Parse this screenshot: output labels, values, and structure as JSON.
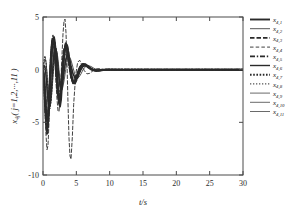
{
  "chart_data": {
    "type": "line",
    "title": "",
    "subtitle": "",
    "xlabel": "t/s",
    "ylabel": "x4j (j=1,2,...,11)",
    "ylabel_base": "x",
    "ylabel_base_sub": "4j",
    "ylabel_paren": "( j=1,2,···,11 )",
    "xlim": [
      0,
      30
    ],
    "ylim": [
      -10,
      5
    ],
    "xticks": [
      0,
      5,
      10,
      15,
      20,
      25,
      30
    ],
    "xticklabels": [
      "0",
      "5",
      "10",
      "15",
      "20",
      "25",
      "30"
    ],
    "yticks": [
      5,
      0,
      -5,
      -10
    ],
    "yticklabels": [
      "5",
      "0",
      "-5",
      "-10"
    ],
    "grid": false,
    "legend_position": "outside-right",
    "line_color": "#2a2a2a",
    "series": [
      {
        "name": "x4,1",
        "label_base": "x",
        "label_sub": "4,1",
        "style": "solid",
        "width": 1.9,
        "dash": "none",
        "x": [
          0,
          0.15,
          0.3,
          0.45,
          0.6,
          0.75,
          0.9,
          1.05,
          1.2,
          1.35,
          1.5,
          1.65,
          1.8,
          1.95,
          2.1,
          2.25,
          2.4,
          2.55,
          2.7,
          2.85,
          3.0,
          3.2,
          3.4,
          3.6,
          3.8,
          4.0,
          4.2,
          4.5,
          4.8,
          5.1,
          5.4,
          5.7,
          6.0,
          6.4,
          6.8,
          7.2,
          7.6,
          8.0,
          8.5,
          9.0,
          9.5,
          10.0,
          11,
          13,
          16,
          20,
          25,
          30
        ],
        "y": [
          0,
          -0.9,
          -2.6,
          -4.4,
          -5.6,
          -5.2,
          -3.4,
          -1.0,
          0.9,
          2.2,
          2.9,
          3.1,
          2.5,
          1.2,
          -0.6,
          -2.2,
          -3.2,
          -3.5,
          -2.9,
          -1.5,
          0.2,
          1.7,
          2.4,
          2.3,
          1.6,
          0.5,
          -0.5,
          -1.3,
          -1.2,
          -0.7,
          -0.1,
          0.35,
          0.55,
          0.5,
          0.28,
          0.08,
          -0.05,
          -0.1,
          -0.08,
          -0.03,
          0.0,
          0.01,
          0.0,
          0,
          0,
          0,
          0,
          0
        ]
      },
      {
        "name": "x4,2",
        "label_base": "x",
        "label_sub": "4,2",
        "style": "solid",
        "width": 0.8,
        "dash": "none",
        "x": [
          0,
          0.15,
          0.3,
          0.45,
          0.6,
          0.75,
          0.9,
          1.05,
          1.2,
          1.35,
          1.5,
          1.65,
          1.8,
          1.95,
          2.1,
          2.25,
          2.4,
          2.55,
          2.7,
          2.85,
          3.0,
          3.2,
          3.4,
          3.6,
          3.8,
          4.0,
          4.2,
          4.5,
          4.8,
          5.1,
          5.4,
          5.7,
          6.0,
          6.4,
          6.8,
          7.2,
          7.6,
          8.0,
          8.5,
          9.0,
          9.5,
          10.0,
          11,
          13,
          16,
          20,
          25,
          30
        ],
        "y": [
          0,
          0.6,
          1.0,
          0.7,
          -0.3,
          -1.7,
          -2.9,
          -3.4,
          -3.0,
          -2.0,
          -0.7,
          0.6,
          1.5,
          1.9,
          1.7,
          1.0,
          0.0,
          -1.0,
          -1.7,
          -1.9,
          -1.6,
          -0.9,
          0.0,
          0.8,
          1.2,
          1.2,
          0.9,
          0.2,
          -0.5,
          -0.8,
          -0.7,
          -0.4,
          0.0,
          0.3,
          0.4,
          0.3,
          0.15,
          0.02,
          -0.06,
          -0.05,
          -0.02,
          0.0,
          0,
          0,
          0,
          0,
          0,
          0
        ]
      },
      {
        "name": "x4,3",
        "label_base": "x",
        "label_sub": "4,3",
        "style": "dashed",
        "width": 1.9,
        "dash": "4.5,2",
        "x": [
          0,
          0.15,
          0.3,
          0.45,
          0.6,
          0.75,
          0.9,
          1.05,
          1.2,
          1.35,
          1.5,
          1.65,
          1.8,
          1.95,
          2.1,
          2.25,
          2.4,
          2.55,
          2.7,
          2.85,
          3.0,
          3.2,
          3.4,
          3.6,
          3.8,
          4.0,
          4.2,
          4.5,
          4.8,
          5.1,
          5.4,
          5.7,
          6.0,
          6.4,
          6.8,
          7.2,
          7.6,
          8.0,
          8.5,
          9.0,
          9.5,
          10.0,
          11,
          13,
          16,
          20,
          25,
          30
        ],
        "y": [
          0,
          -1.2,
          -3.0,
          -4.6,
          -5.2,
          -4.4,
          -2.5,
          -0.3,
          1.5,
          2.6,
          3.0,
          2.7,
          1.7,
          0.3,
          -1.2,
          -2.4,
          -3.0,
          -2.9,
          -2.1,
          -0.8,
          0.7,
          1.9,
          2.5,
          2.4,
          1.7,
          0.7,
          -0.3,
          -1.2,
          -1.3,
          -0.9,
          -0.3,
          0.25,
          0.5,
          0.5,
          0.3,
          0.1,
          -0.03,
          -0.09,
          -0.07,
          -0.03,
          0.0,
          0.0,
          0,
          0,
          0,
          0,
          0,
          0
        ]
      },
      {
        "name": "x4,4",
        "label_base": "x",
        "label_sub": "4,4",
        "style": "dashed",
        "width": 0.9,
        "dash": "3.5,2.2",
        "x": [
          0,
          0.15,
          0.3,
          0.45,
          0.6,
          0.75,
          0.9,
          1.05,
          1.2,
          1.35,
          1.5,
          1.65,
          1.8,
          1.95,
          2.1,
          2.25,
          2.4,
          2.6,
          2.8,
          3.0,
          3.15,
          3.3,
          3.45,
          3.6,
          3.75,
          3.9,
          4.05,
          4.2,
          4.4,
          4.6,
          4.9,
          5.2,
          5.5,
          5.8,
          6.2,
          6.6,
          7.0,
          7.5,
          8.0,
          8.5,
          9.0,
          9.5,
          10.0,
          11,
          13,
          16,
          20,
          25,
          30
        ],
        "y": [
          0,
          -1.8,
          -4.0,
          -6.2,
          -7.6,
          -7.2,
          -5.0,
          -1.8,
          1.2,
          3.0,
          3.3,
          2.4,
          0.7,
          -1.2,
          -2.8,
          -3.9,
          -4.0,
          -2.4,
          0.7,
          3.4,
          4.6,
          4.8,
          3.5,
          0.6,
          -3.2,
          -6.5,
          -8.2,
          -8.5,
          -6.4,
          -3.3,
          -0.5,
          0.7,
          0.9,
          0.5,
          -0.1,
          -0.4,
          -0.35,
          -0.1,
          0.08,
          0.1,
          0.05,
          0.0,
          0.0,
          0,
          0,
          0,
          0,
          0,
          0
        ]
      },
      {
        "name": "x4,5",
        "label_base": "x",
        "label_sub": "4,5",
        "style": "dashdot",
        "width": 1.8,
        "dash": "5,1.8,1.4,1.8",
        "x": [
          0,
          0.15,
          0.3,
          0.45,
          0.6,
          0.75,
          0.9,
          1.05,
          1.2,
          1.35,
          1.5,
          1.65,
          1.8,
          1.95,
          2.1,
          2.25,
          2.4,
          2.55,
          2.7,
          2.85,
          3.0,
          3.2,
          3.4,
          3.6,
          3.8,
          4.0,
          4.2,
          4.5,
          4.8,
          5.1,
          5.4,
          5.7,
          6.0,
          6.4,
          6.8,
          7.2,
          7.6,
          8.0,
          8.5,
          9.0,
          9.5,
          10.0,
          11,
          13,
          16,
          20,
          25,
          30
        ],
        "y": [
          0,
          -0.7,
          -2.0,
          -3.6,
          -4.8,
          -4.9,
          -3.6,
          -1.5,
          0.6,
          2.1,
          2.9,
          3.0,
          2.4,
          1.2,
          -0.3,
          -1.7,
          -2.6,
          -2.8,
          -2.3,
          -1.1,
          0.3,
          1.5,
          2.1,
          2.0,
          1.3,
          0.3,
          -0.6,
          -1.2,
          -1.1,
          -0.6,
          0.0,
          0.35,
          0.5,
          0.45,
          0.25,
          0.05,
          -0.06,
          -0.09,
          -0.06,
          -0.02,
          0.0,
          0.0,
          0,
          0,
          0,
          0,
          0,
          0
        ]
      },
      {
        "name": "x4,6",
        "label_base": "x",
        "label_sub": "4,6",
        "style": "solid",
        "width": 1.4,
        "dash": "none",
        "x": [
          0,
          0.15,
          0.3,
          0.45,
          0.6,
          0.75,
          0.9,
          1.05,
          1.2,
          1.35,
          1.5,
          1.65,
          1.8,
          1.95,
          2.1,
          2.25,
          2.4,
          2.55,
          2.7,
          2.85,
          3.0,
          3.2,
          3.4,
          3.6,
          3.8,
          4.0,
          4.2,
          4.5,
          4.8,
          5.1,
          5.4,
          5.7,
          6.0,
          6.4,
          6.8,
          7.2,
          7.6,
          8.0,
          8.5,
          9.0,
          9.5,
          10.0,
          11,
          13,
          16,
          20,
          25,
          30
        ],
        "y": [
          0,
          0.4,
          0.3,
          -0.5,
          -1.8,
          -3.0,
          -3.6,
          -3.4,
          -2.4,
          -1.0,
          0.5,
          1.6,
          2.1,
          2.0,
          1.3,
          0.3,
          -0.8,
          -1.6,
          -1.9,
          -1.7,
          -1.0,
          0.0,
          0.9,
          1.4,
          1.4,
          1.0,
          0.4,
          -0.4,
          -0.8,
          -0.8,
          -0.4,
          0.0,
          0.3,
          0.4,
          0.3,
          0.12,
          -0.02,
          -0.08,
          -0.07,
          -0.03,
          0.0,
          0.0,
          0,
          0,
          0,
          0,
          0,
          0
        ]
      },
      {
        "name": "x4,7",
        "label_base": "x",
        "label_sub": "4,7",
        "style": "dotted",
        "width": 1.9,
        "dash": "1.6,1.6",
        "x": [
          0,
          0.15,
          0.3,
          0.45,
          0.6,
          0.75,
          0.9,
          1.05,
          1.2,
          1.35,
          1.5,
          1.65,
          1.8,
          1.95,
          2.1,
          2.25,
          2.4,
          2.55,
          2.7,
          2.85,
          3.0,
          3.2,
          3.4,
          3.6,
          3.8,
          4.0,
          4.2,
          4.5,
          4.8,
          5.1,
          5.4,
          5.7,
          6.0,
          6.4,
          6.8,
          7.2,
          7.6,
          8.0,
          8.5,
          9.0,
          9.5,
          10.0,
          11,
          13,
          16,
          20,
          25,
          30
        ],
        "y": [
          0,
          -1.4,
          -3.4,
          -5.2,
          -6.1,
          -5.4,
          -3.4,
          -0.8,
          1.4,
          2.6,
          2.9,
          2.4,
          1.3,
          -0.2,
          -1.6,
          -2.5,
          -2.8,
          -2.4,
          -1.4,
          -0.1,
          1.1,
          2.0,
          2.2,
          1.8,
          1.0,
          0.1,
          -0.7,
          -1.2,
          -1.0,
          -0.5,
          0.1,
          0.4,
          0.5,
          0.4,
          0.2,
          0.02,
          -0.07,
          -0.09,
          -0.06,
          -0.02,
          0.0,
          0.0,
          0,
          0,
          0,
          0,
          0,
          0
        ]
      },
      {
        "name": "x4,8",
        "label_base": "x",
        "label_sub": "4,8",
        "style": "dotted",
        "width": 1.0,
        "dash": "1.3,1.7",
        "x": [
          0,
          0.15,
          0.3,
          0.45,
          0.6,
          0.75,
          0.9,
          1.05,
          1.2,
          1.35,
          1.5,
          1.65,
          1.8,
          1.95,
          2.1,
          2.25,
          2.4,
          2.55,
          2.7,
          2.85,
          3.0,
          3.2,
          3.4,
          3.6,
          3.8,
          4.0,
          4.2,
          4.5,
          4.8,
          5.1,
          5.4,
          5.7,
          6.0,
          6.4,
          6.8,
          7.2,
          7.6,
          8.0,
          8.5,
          9.0,
          9.5,
          10.0,
          11,
          13,
          16,
          20,
          25,
          30
        ],
        "y": [
          0,
          0.9,
          1.3,
          0.8,
          -0.5,
          -2.1,
          -3.3,
          -3.7,
          -3.1,
          -1.8,
          -0.2,
          1.1,
          1.9,
          2.0,
          1.5,
          0.5,
          -0.6,
          -1.4,
          -1.8,
          -1.7,
          -1.1,
          -0.1,
          0.8,
          1.3,
          1.3,
          0.9,
          0.3,
          -0.4,
          -0.8,
          -0.7,
          -0.3,
          0.1,
          0.35,
          0.4,
          0.25,
          0.08,
          -0.04,
          -0.08,
          -0.05,
          -0.02,
          0.0,
          0.0,
          0,
          0,
          0,
          0,
          0,
          0
        ]
      },
      {
        "name": "x4,9",
        "label_base": "x",
        "label_sub": "4,9",
        "style": "solid",
        "width": 0.7,
        "dash": "none",
        "x": [
          0,
          0.15,
          0.3,
          0.45,
          0.6,
          0.75,
          0.9,
          1.05,
          1.2,
          1.35,
          1.5,
          1.65,
          1.8,
          1.95,
          2.1,
          2.25,
          2.4,
          2.55,
          2.7,
          2.85,
          3.0,
          3.2,
          3.4,
          3.6,
          3.8,
          4.0,
          4.2,
          4.5,
          4.8,
          5.1,
          5.4,
          5.7,
          6.0,
          6.4,
          6.8,
          7.2,
          7.6,
          8.0,
          8.5,
          9.0,
          9.5,
          10.0,
          11,
          13,
          16,
          20,
          25,
          30
        ],
        "y": [
          0,
          -0.5,
          -1.6,
          -3.0,
          -4.2,
          -4.6,
          -3.9,
          -2.2,
          -0.2,
          1.4,
          2.3,
          2.5,
          2.1,
          1.1,
          -0.2,
          -1.4,
          -2.2,
          -2.4,
          -2.0,
          -1.0,
          0.2,
          1.3,
          1.8,
          1.7,
          1.1,
          0.3,
          -0.4,
          -1.0,
          -0.9,
          -0.5,
          0.0,
          0.3,
          0.45,
          0.4,
          0.22,
          0.04,
          -0.06,
          -0.08,
          -0.05,
          -0.02,
          0.0,
          0.0,
          0,
          0,
          0,
          0,
          0,
          0
        ]
      },
      {
        "name": "x4,10",
        "label_base": "x",
        "label_sub": "4,10",
        "style": "solid",
        "width": 0.7,
        "dash": "none",
        "x": [
          0,
          0.15,
          0.3,
          0.45,
          0.6,
          0.75,
          0.9,
          1.05,
          1.2,
          1.35,
          1.5,
          1.65,
          1.8,
          1.95,
          2.1,
          2.25,
          2.4,
          2.55,
          2.7,
          2.85,
          3.0,
          3.2,
          3.4,
          3.6,
          3.8,
          4.0,
          4.2,
          4.5,
          4.8,
          5.1,
          5.4,
          5.7,
          6.0,
          6.4,
          6.8,
          7.2,
          7.6,
          8.0,
          8.5,
          9.0,
          9.5,
          10.0,
          11,
          13,
          16,
          20,
          25,
          30
        ],
        "y": [
          0,
          0.3,
          0.1,
          -0.8,
          -2.0,
          -3.1,
          -3.5,
          -3.1,
          -2.0,
          -0.6,
          0.8,
          1.7,
          2.0,
          1.8,
          1.0,
          0.0,
          -0.9,
          -1.6,
          -1.7,
          -1.4,
          -0.7,
          0.2,
          1.0,
          1.3,
          1.2,
          0.8,
          0.2,
          -0.4,
          -0.7,
          -0.6,
          -0.3,
          0.05,
          0.3,
          0.35,
          0.22,
          0.06,
          -0.04,
          -0.07,
          -0.05,
          -0.02,
          0.0,
          0.0,
          0,
          0,
          0,
          0,
          0,
          0
        ]
      },
      {
        "name": "x4,11",
        "label_base": "x",
        "label_sub": "4,11",
        "style": "solid",
        "width": 0.7,
        "dash": "none",
        "x": [
          0,
          0.15,
          0.3,
          0.45,
          0.6,
          0.75,
          0.9,
          1.05,
          1.2,
          1.35,
          1.5,
          1.65,
          1.8,
          1.95,
          2.1,
          2.25,
          2.4,
          2.55,
          2.7,
          2.85,
          3.0,
          3.2,
          3.4,
          3.6,
          3.8,
          4.0,
          4.2,
          4.5,
          4.8,
          5.1,
          5.4,
          5.7,
          6.0,
          6.4,
          6.8,
          7.2,
          7.6,
          8.0,
          8.5,
          9.0,
          9.5,
          10.0,
          11,
          13,
          16,
          20,
          25,
          30
        ],
        "y": [
          0,
          -0.3,
          -1.2,
          -2.4,
          -3.5,
          -4.0,
          -3.6,
          -2.3,
          -0.6,
          0.9,
          1.9,
          2.2,
          1.9,
          1.1,
          0.0,
          -1.1,
          -1.9,
          -2.1,
          -1.8,
          -1.0,
          0.0,
          1.0,
          1.5,
          1.5,
          1.0,
          0.3,
          -0.3,
          -0.8,
          -0.8,
          -0.5,
          -0.05,
          0.25,
          0.4,
          0.35,
          0.2,
          0.04,
          -0.05,
          -0.07,
          -0.05,
          -0.02,
          0.0,
          0.0,
          0,
          0,
          0,
          0,
          0,
          0
        ]
      }
    ]
  }
}
